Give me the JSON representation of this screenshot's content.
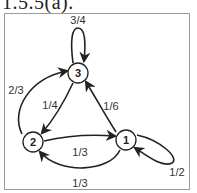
{
  "title": "1.5.5(a).",
  "colors": {
    "stroke": "#222222",
    "frame": "#9a9a9a",
    "text": "#333333"
  },
  "nodes": [
    {
      "id": "1",
      "label": "1",
      "x": 126,
      "y": 140
    },
    {
      "id": "2",
      "label": "2",
      "x": 33,
      "y": 142
    },
    {
      "id": "3",
      "label": "3",
      "x": 78,
      "y": 73
    }
  ],
  "edges": [
    {
      "from": "3",
      "to": "3",
      "label": "3/4",
      "label_x": 78,
      "label_y": 20
    },
    {
      "from": "3",
      "to": "2",
      "label": "1/4",
      "label_x": 50,
      "label_y": 105
    },
    {
      "from": "2",
      "to": "3",
      "label": "2/3",
      "label_x": 16,
      "label_y": 90
    },
    {
      "from": "1",
      "to": "3",
      "label": "1/6",
      "label_x": 111,
      "label_y": 106
    },
    {
      "from": "2",
      "to": "1",
      "label": "1/3",
      "label_x": 80,
      "label_y": 152
    },
    {
      "from": "1",
      "to": "2",
      "label": "1/3",
      "label_x": 80,
      "label_y": 183
    },
    {
      "from": "1",
      "to": "1",
      "label": "1/2",
      "label_x": 177,
      "label_y": 172
    }
  ]
}
